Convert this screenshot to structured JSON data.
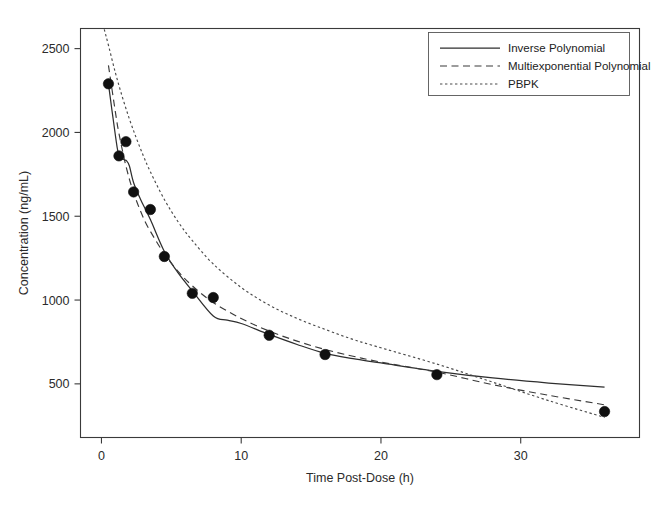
{
  "chart_data": {
    "type": "line",
    "title": "",
    "xlabel": "Time Post-Dose (h)",
    "ylabel": "Concentration (ng/mL)",
    "xlim": [
      -1.5,
      38.5
    ],
    "ylim": [
      180,
      2620
    ],
    "xticks": [
      0,
      10,
      20,
      30
    ],
    "xticklabels": [
      "0",
      "10",
      "20",
      "30"
    ],
    "yticks": [
      500,
      1000,
      1500,
      2000,
      2500
    ],
    "yticklabels": [
      "500",
      "1000",
      "1500",
      "2000",
      "2500"
    ],
    "grid": false,
    "legend_position": "top-right",
    "observed": {
      "name": "Observed Concentrations",
      "marker": "filled-circle",
      "x": [
        0.5,
        1.25,
        1.75,
        2.3,
        3.5,
        4.5,
        6.5,
        8.0,
        12.0,
        16.0,
        24.0,
        36.0
      ],
      "y": [
        2290,
        1860,
        1945,
        1645,
        1540,
        1260,
        1040,
        1015,
        790,
        675,
        555,
        335
      ]
    },
    "series": [
      {
        "name": "Inverse Polynomial",
        "style": "solid",
        "x": [
          0.5,
          1.0,
          1.25,
          1.6,
          1.8,
          2.0,
          2.3,
          2.8,
          3.5,
          4.5,
          5.5,
          6.5,
          8.0,
          9.0,
          10.0,
          12.0,
          14.0,
          16.0,
          18.0,
          20.0,
          24.0,
          28.0,
          32.0,
          36.0
        ],
        "y": [
          2290,
          1980,
          1862,
          1838,
          1830,
          1800,
          1700,
          1600,
          1480,
          1290,
          1160,
          1055,
          905,
          880,
          860,
          795,
          735,
          682,
          650,
          625,
          575,
          535,
          505,
          480
        ]
      },
      {
        "name": "Multiexponential Polynomial",
        "style": "dashed",
        "x": [
          0.5,
          1.0,
          1.25,
          1.75,
          2.3,
          3.0,
          3.5,
          4.5,
          5.5,
          6.5,
          8.0,
          10.0,
          12.0,
          14.0,
          16.0,
          18.0,
          20.0,
          24.0,
          28.0,
          32.0,
          36.0
        ],
        "y": [
          2400,
          2120,
          1995,
          1800,
          1640,
          1490,
          1410,
          1275,
          1170,
          1085,
          985,
          890,
          815,
          755,
          705,
          665,
          630,
          570,
          495,
          432,
          375
        ]
      },
      {
        "name": "PBPK",
        "style": "dotted",
        "x": [
          0.2,
          0.5,
          1.0,
          1.5,
          2.0,
          2.5,
          3.0,
          3.5,
          4.5,
          5.5,
          6.5,
          8.0,
          10.0,
          12.0,
          14.0,
          16.0,
          18.0,
          20.0,
          24.0,
          28.0,
          32.0,
          36.0
        ],
        "y": [
          2615,
          2520,
          2355,
          2210,
          2080,
          1965,
          1860,
          1765,
          1600,
          1465,
          1355,
          1215,
          1075,
          970,
          890,
          825,
          765,
          715,
          618,
          510,
          400,
          300
        ]
      }
    ]
  },
  "legend": {
    "entries": [
      {
        "label": "Inverse Polynomial",
        "style": "solid"
      },
      {
        "label": "Multiexponential Polynomial",
        "style": "dashed"
      },
      {
        "label": "PBPK",
        "style": "dotted"
      }
    ]
  }
}
